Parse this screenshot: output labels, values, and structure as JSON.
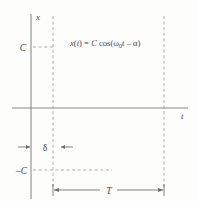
{
  "figure": {
    "background_color": "#fdfdfc",
    "curve_color": "#7a7a7a",
    "axis_color": "#8a8a8a",
    "dash_color": "#9a9a9a",
    "text_color": "#4a4a4a",
    "equation": {
      "lhs_x": "x",
      "lhs_paren_open": "(",
      "lhs_t": "t",
      "lhs_paren_close": ")",
      "equals": " = ",
      "amplitude": "C",
      "cos": " cos(",
      "omega": "ω",
      "omega_sub": "0",
      "time_var": "t",
      "minus": " – ",
      "phase": "α",
      "close_paren": ")",
      "full": "x(t) = C cos(ω₀t – α)"
    },
    "labels": {
      "y_axis": "x",
      "x_axis": "t",
      "amplitude_positive": "C",
      "amplitude_negative": "–C",
      "phase_delay": "δ",
      "period": "T"
    }
  },
  "chart_data": {
    "type": "line",
    "xlabel": "t",
    "ylabel": "x",
    "grid": false,
    "legend": null,
    "axis_origin_px": {
      "x": 31,
      "y": 108
    },
    "xlim": [
      -0.12,
      1.3
    ],
    "ylim": [
      -1.35,
      1.35
    ],
    "y_ticks": [
      {
        "label": "C",
        "value": 1
      },
      {
        "label": "–C",
        "value": -1
      }
    ],
    "series": [
      {
        "name": "x(t) = C cos(ω₀t – α)",
        "amplitude_C": 1,
        "period_T": 1,
        "phase_delay_delta": 0.2,
        "x": [
          -0.12,
          -0.08,
          -0.04,
          0.0,
          0.04,
          0.08,
          0.12,
          0.16,
          0.2,
          0.24,
          0.28,
          0.32,
          0.36,
          0.4,
          0.45,
          0.5,
          0.55,
          0.6,
          0.65,
          0.7,
          0.75,
          0.8,
          0.85,
          0.9,
          0.95,
          1.0,
          1.05,
          1.1,
          1.15,
          1.2,
          1.25,
          1.3
        ],
        "y": [
          -0.95,
          -0.72,
          -0.45,
          -0.16,
          0.16,
          0.45,
          0.72,
          0.92,
          1.0,
          0.97,
          0.84,
          0.62,
          0.34,
          0.03,
          -0.38,
          -0.72,
          -0.93,
          -1.0,
          -0.93,
          -0.72,
          -0.38,
          0.03,
          0.45,
          0.78,
          0.96,
          1.0,
          0.96,
          0.78,
          0.45,
          0.03,
          -0.38,
          -0.72
        ]
      }
    ],
    "annotations": [
      {
        "name": "amplitude-upper-dashed",
        "type": "hline",
        "value": 1,
        "style": "dashed",
        "from_x": 0.0,
        "to_x": 0.2
      },
      {
        "name": "amplitude-lower-dashed",
        "type": "hline",
        "value": -1,
        "style": "dashed",
        "from_x": 0.0,
        "to_x": 0.7
      },
      {
        "name": "peak1-vline",
        "type": "vline",
        "value": 0.2,
        "style": "dashed"
      },
      {
        "name": "peak2-vline",
        "type": "vline",
        "value": 1.2,
        "style": "dashed"
      },
      {
        "name": "delta-dimension",
        "type": "dimension",
        "label": "δ",
        "from_x": 0.0,
        "to_x": 0.2,
        "arrow_direction": "outward"
      },
      {
        "name": "period-dimension",
        "type": "dimension",
        "label": "T",
        "from_x": 0.2,
        "to_x": 1.2,
        "arrow_direction": "inward"
      }
    ]
  }
}
